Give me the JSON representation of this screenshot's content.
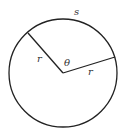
{
  "diagram": {
    "type": "circle-sector-arc-length",
    "circle": {
      "cx": 63,
      "cy": 73,
      "r": 54,
      "stroke": "#222222"
    },
    "radius_lines": [
      {
        "x1": 63,
        "y1": 73,
        "x2": 28,
        "y2": 32
      },
      {
        "x1": 63,
        "y1": 73,
        "x2": 115,
        "y2": 57
      }
    ],
    "labels": {
      "arc": "s",
      "radius_left": "r",
      "radius_right": "r",
      "angle": "θ"
    }
  }
}
